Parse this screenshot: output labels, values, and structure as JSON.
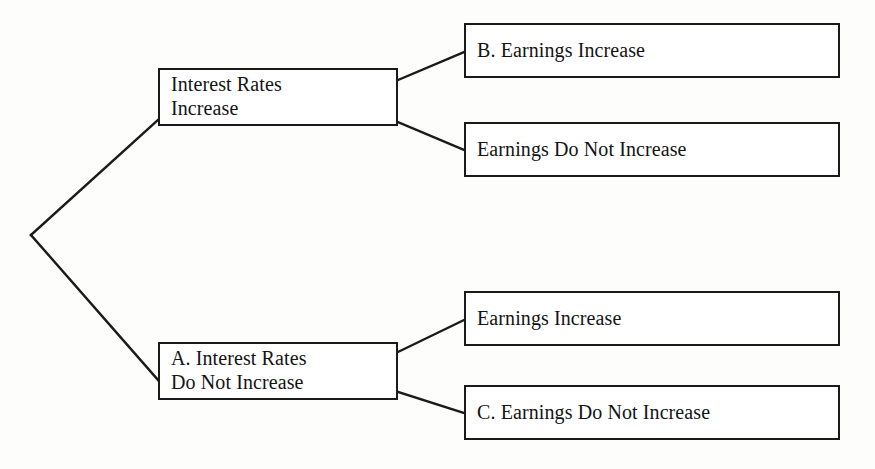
{
  "diagram": {
    "type": "decision-tree",
    "background_color": "#fdfdfb",
    "line_color": "#1a1a1a",
    "box_fill": "#ffffff",
    "text_color": "#141414",
    "root": {
      "label": "",
      "x": 31,
      "y": 235
    },
    "nodes": [
      {
        "id": "interest-rates-increase",
        "level": 1,
        "lines": [
          "Interest Rates",
          "Increase"
        ],
        "x": 158,
        "y": 68,
        "width": 240,
        "height": 58
      },
      {
        "id": "earnings-increase-b",
        "level": 2,
        "lines": [
          "B. Earnings Increase"
        ],
        "x": 464,
        "y": 23,
        "width": 376,
        "height": 55
      },
      {
        "id": "earnings-do-not-increase",
        "level": 2,
        "lines": [
          "Earnings Do Not Increase"
        ],
        "x": 464,
        "y": 122,
        "width": 376,
        "height": 55
      },
      {
        "id": "interest-rates-do-not-increase-a",
        "level": 1,
        "lines": [
          "A. Interest Rates",
          "Do Not Increase"
        ],
        "x": 158,
        "y": 342,
        "width": 240,
        "height": 58
      },
      {
        "id": "earnings-increase",
        "level": 2,
        "lines": [
          "Earnings Increase"
        ],
        "x": 464,
        "y": 291,
        "width": 376,
        "height": 55
      },
      {
        "id": "earnings-do-not-increase-c",
        "level": 2,
        "lines": [
          "C. Earnings Do Not Increase"
        ],
        "x": 464,
        "y": 385,
        "width": 376,
        "height": 55
      }
    ],
    "edges": [
      {
        "id": "root-to-interest-rates-increase",
        "from": "root",
        "to": "interest-rates-increase",
        "x1": 31,
        "y1": 235,
        "x2": 158,
        "y2": 120
      },
      {
        "id": "root-to-interest-rates-do-not-increase",
        "from": "root",
        "to": "interest-rates-do-not-increase-a",
        "x1": 31,
        "y1": 235,
        "x2": 158,
        "y2": 380
      },
      {
        "id": "interest-rates-increase-to-b",
        "from": "interest-rates-increase",
        "to": "earnings-increase-b",
        "x1": 398,
        "y1": 80,
        "x2": 464,
        "y2": 52
      },
      {
        "id": "interest-rates-increase-to-no-earnings",
        "from": "interest-rates-increase",
        "to": "earnings-do-not-increase",
        "x1": 398,
        "y1": 122,
        "x2": 464,
        "y2": 150
      },
      {
        "id": "a-to-earnings-increase",
        "from": "interest-rates-do-not-increase-a",
        "to": "earnings-increase",
        "x1": 398,
        "y1": 352,
        "x2": 464,
        "y2": 320
      },
      {
        "id": "a-to-c",
        "from": "interest-rates-do-not-increase-a",
        "to": "earnings-do-not-increase-c",
        "x1": 398,
        "y1": 392,
        "x2": 464,
        "y2": 413
      }
    ]
  }
}
